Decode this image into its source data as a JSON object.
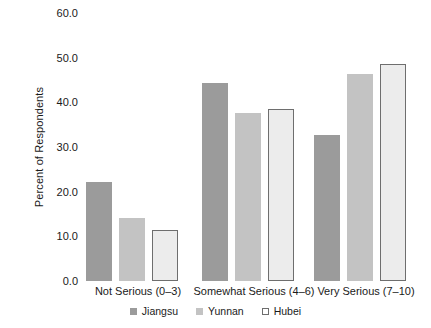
{
  "chart_data": {
    "type": "bar",
    "title": "",
    "xlabel": "",
    "ylabel": "Percent of Respondents",
    "ylim": [
      0,
      60
    ],
    "yticks": [
      0,
      10,
      20,
      30,
      40,
      50,
      60
    ],
    "ytick_labels": [
      "0.0",
      "10.0",
      "20.0",
      "30.0",
      "40.0",
      "50.0",
      "60.0"
    ],
    "grid": false,
    "legend_position": "bottom-center",
    "categories": [
      "Not Serious (0–3)",
      "Somewhat Serious (4–6)",
      "Very Serious (7–10)"
    ],
    "series": [
      {
        "name": "Jiangsu",
        "color": "#9b9b9b",
        "values": [
          22.2,
          44.3,
          32.7
        ]
      },
      {
        "name": "Yunnan",
        "color": "#c3c3c3",
        "values": [
          14.1,
          37.6,
          46.4
        ]
      },
      {
        "name": "Hubei",
        "color": "#ececec",
        "values": [
          11.4,
          38.6,
          48.5
        ]
      }
    ]
  },
  "legend": {
    "items": [
      {
        "label": "Jiangsu"
      },
      {
        "label": "Yunnan"
      },
      {
        "label": "Hubei"
      }
    ]
  }
}
